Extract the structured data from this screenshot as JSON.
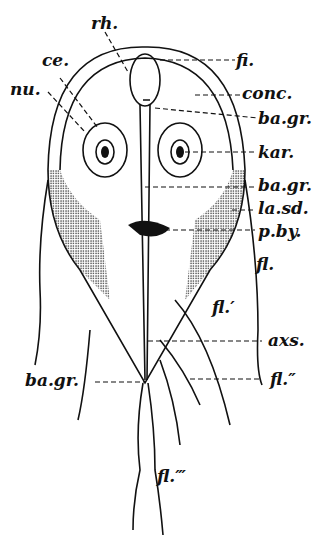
{
  "figure": {
    "labels": {
      "rh": "rh.",
      "ce": "ce.",
      "nu": "nu.",
      "fi": "fi.",
      "conc": "conc.",
      "ba_gr_top": "ba.gr.",
      "kar": "kar.",
      "ba_gr_mid": "ba.gr.",
      "la_sd": "la.sd.",
      "p_by": "p.by.",
      "fl": "fl.",
      "fl1": "fl.′",
      "axs": "axs.",
      "ba_gr_bottom": "ba.gr.",
      "fl2": "fl.″",
      "fl3": "fl.‴"
    }
  }
}
